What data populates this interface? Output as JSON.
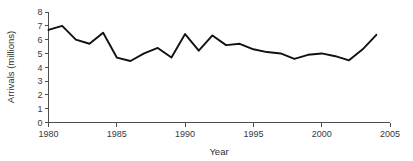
{
  "chart_data": {
    "type": "line",
    "title": "",
    "subtitle": "",
    "xlabel": "Year",
    "ylabel": "Arrivals (millions)",
    "xlim": [
      1980,
      2005
    ],
    "ylim": [
      0,
      8
    ],
    "grid": false,
    "legend": "none",
    "xticks": [
      1980,
      1985,
      1990,
      1995,
      2000,
      2005
    ],
    "xtick_labels": [
      "1980",
      "1985",
      "1990",
      "1995",
      "2000",
      "2005"
    ],
    "yticks": [
      0,
      1,
      2,
      3,
      4,
      5,
      6,
      7,
      8
    ],
    "ytick_labels": [
      "0",
      "1",
      "2",
      "3",
      "4",
      "5",
      "6",
      "7",
      "8"
    ],
    "x": [
      1980,
      1981,
      1982,
      1983,
      1984,
      1985,
      1986,
      1987,
      1988,
      1989,
      1990,
      1991,
      1992,
      1993,
      1994,
      1995,
      1996,
      1997,
      1998,
      1999,
      2000,
      2001,
      2002,
      2003,
      2004
    ],
    "series": [
      {
        "name": "Arrivals",
        "color": "#111111",
        "values": [
          6.7,
          7.0,
          6.0,
          5.7,
          6.5,
          4.7,
          4.45,
          5.0,
          5.4,
          4.7,
          6.4,
          5.2,
          6.3,
          5.6,
          5.7,
          5.3,
          5.1,
          5.0,
          4.6,
          4.9,
          5.0,
          4.8,
          4.5,
          5.3,
          6.35
        ]
      }
    ],
    "annotations": [],
    "colors": {
      "line": "#111111",
      "axis": "#4d4d4d",
      "text": "#2e2e2e",
      "background": "#ffffff"
    }
  },
  "axis": {
    "y_title": "Arrivals (millions)",
    "x_title": "Year"
  }
}
